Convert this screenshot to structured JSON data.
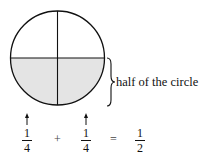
{
  "diagram": {
    "circle": {
      "parts": 4,
      "shaded_parts": 2,
      "shaded_region": "bottom half",
      "shade_color": "#e4e4e4",
      "stroke_color": "#111111"
    },
    "brace_label": "half of the circle",
    "equation": {
      "terms": [
        {
          "numerator": "1",
          "denominator": "4",
          "arrow": true
        },
        {
          "operator": "+"
        },
        {
          "numerator": "1",
          "denominator": "4",
          "arrow": true
        },
        {
          "operator": "="
        },
        {
          "numerator": "1",
          "denominator": "2",
          "arrow": false
        }
      ]
    }
  }
}
